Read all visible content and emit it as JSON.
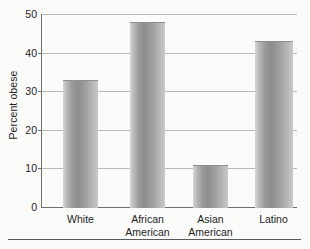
{
  "chart_data": {
    "type": "bar",
    "title": "",
    "subtitle": "",
    "xlabel": "",
    "ylabel": "Percent obese",
    "categories": [
      "White",
      "African American",
      "Asian American",
      "Latino"
    ],
    "category_lines": [
      [
        "White"
      ],
      [
        "African",
        "American"
      ],
      [
        "Asian",
        "American"
      ],
      [
        "Latino"
      ]
    ],
    "values": [
      33,
      48,
      11,
      43
    ],
    "ylim": [
      0,
      50
    ],
    "yticks": [
      0,
      10,
      20,
      30,
      40,
      50
    ],
    "ytick_labels": [
      "0",
      "10",
      "20",
      "30",
      "40",
      "50"
    ],
    "grid": "horizontal",
    "legend": "none",
    "bar_fill": "#9a9a9a",
    "grid_color": "#b9b9b9",
    "axis_color": "#6f6f6f",
    "background": "#fbfbfa"
  }
}
